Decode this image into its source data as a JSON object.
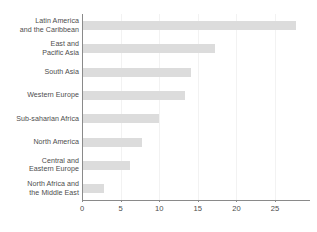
{
  "chart_data": {
    "type": "bar",
    "orientation": "horizontal",
    "title": "",
    "subtitle": "",
    "xlabel": "",
    "ylabel": "",
    "categories": [
      "Latin America\nand the Caribbean",
      "East and\nPacific Asia",
      "South Asia",
      "Western Europe",
      "Sub-saharian Africa",
      "North America",
      "Central and\nEastern Europe",
      "North Africa and\nthe Middle East"
    ],
    "values": [
      27.7,
      17.2,
      14.1,
      13.3,
      10.0,
      7.8,
      6.2,
      2.9
    ],
    "xlim": [
      0,
      29.5
    ],
    "xticks": [
      0,
      5,
      10,
      15,
      20,
      25
    ],
    "xtick_labels": [
      "0",
      "5",
      "10",
      "15",
      "20",
      "25"
    ],
    "grid": "vertical",
    "legend": "none",
    "bar_color": "#dcdcdc",
    "gridline_color": "#f2f2f2",
    "axis_color": "#8a8a8a",
    "label_color": "#4d4d4d"
  }
}
